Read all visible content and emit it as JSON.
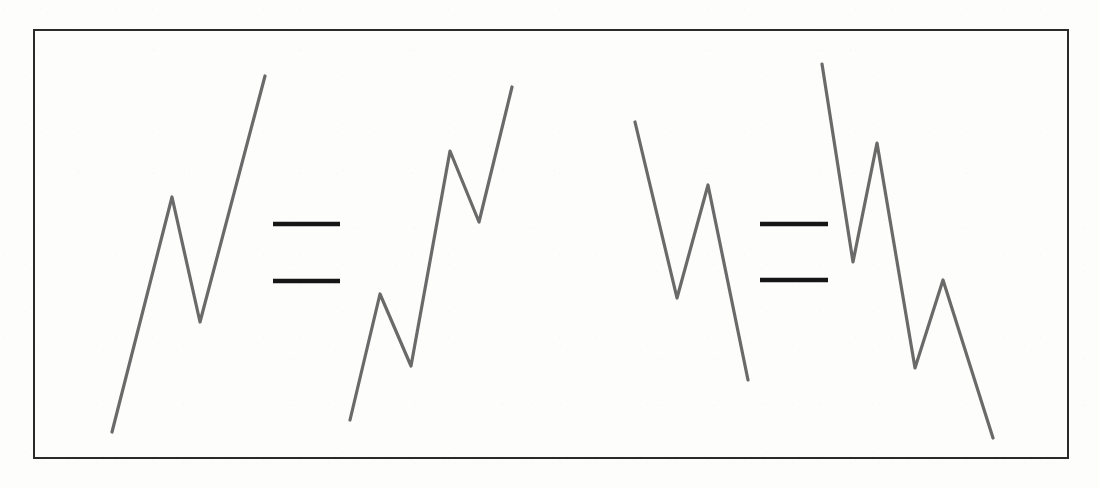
{
  "figure": {
    "background_color": "#fdfdfc",
    "border": {
      "name": "outer-frame",
      "x": 34,
      "y": 30,
      "width": 1034,
      "height": 428,
      "stroke_color": "#2a2a2a",
      "stroke_width": 2,
      "fill": "none"
    },
    "stroke_colors": {
      "polyline": "#6a6a6a",
      "equals_bar": "#161616"
    },
    "polyline_stroke_width": 3.2,
    "equals_bar_height": 4.5,
    "statements": [
      {
        "name": "equality-statement-left",
        "left_operand": "polyline-1",
        "right_operand": "polyline-2",
        "relation": "equals"
      },
      {
        "name": "equality-statement-right",
        "left_operand": "polyline-3",
        "right_operand": "polyline-4",
        "relation": "equals"
      }
    ],
    "shapes": [
      {
        "name": "polyline-1",
        "kind": "polyline",
        "overall_direction": "rising",
        "vertex_count": 4,
        "points": [
          [
            112,
            432
          ],
          [
            172,
            197
          ],
          [
            200,
            322
          ],
          [
            265,
            76
          ]
        ],
        "points_str": "112,432 172,197 200,322 265,76"
      },
      {
        "name": "polyline-2",
        "kind": "polyline",
        "overall_direction": "rising",
        "vertex_count": 6,
        "points": [
          [
            350,
            420
          ],
          [
            380,
            294
          ],
          [
            411,
            366
          ],
          [
            450,
            151
          ],
          [
            479,
            222
          ],
          [
            512,
            87
          ]
        ],
        "points_str": "350,420 380,294 411,366 450,151 479,222 512,87"
      },
      {
        "name": "polyline-3",
        "kind": "polyline",
        "overall_direction": "falling",
        "vertex_count": 4,
        "points": [
          [
            635,
            122
          ],
          [
            677,
            298
          ],
          [
            708,
            185
          ],
          [
            748,
            380
          ]
        ],
        "points_str": "635,122 677,298 708,185 748,380"
      },
      {
        "name": "polyline-4",
        "kind": "polyline",
        "overall_direction": "falling",
        "vertex_count": 6,
        "points": [
          [
            822,
            64
          ],
          [
            853,
            262
          ],
          [
            877,
            143
          ],
          [
            915,
            368
          ],
          [
            943,
            280
          ],
          [
            993,
            438
          ]
        ],
        "points_str": "822,64 853,262 877,143 915,368 943,280 993,438"
      }
    ],
    "equals_signs": [
      {
        "name": "equals-sign-left",
        "glyph": "=",
        "x_start": 273,
        "x_end": 340,
        "bar_top_y": 224,
        "bar_bottom_y": 281
      },
      {
        "name": "equals-sign-right",
        "glyph": "=",
        "x_start": 760,
        "x_end": 828,
        "bar_top_y": 224,
        "bar_bottom_y": 280
      }
    ]
  }
}
